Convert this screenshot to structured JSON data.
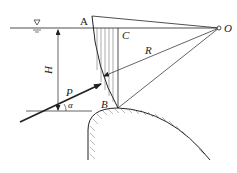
{
  "diagram": {
    "type": "radial-gate hydrostatic force diagram",
    "labels": {
      "A": "A",
      "B": "B",
      "C": "C",
      "O": "O",
      "R": "R",
      "H": "H",
      "P": "P",
      "alpha": "α"
    },
    "symbols": {
      "water_surface": "▽"
    },
    "colors": {
      "line": "#222222",
      "hatch": "#555555",
      "background": "#ffffff"
    }
  }
}
